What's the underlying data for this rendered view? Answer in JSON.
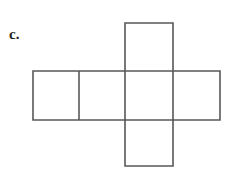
{
  "figure": {
    "label": "c.",
    "caption": "",
    "kind": "cube-net-cross",
    "background_color": "#ffffff",
    "stroke_color": "#58585a",
    "fill_color": "#ffffff",
    "stroke_width": 1.6,
    "square_size": 47,
    "squares_total": 6,
    "horizontal_band": {
      "squares": 4,
      "x": 33,
      "y": 71,
      "width": 187,
      "height": 49,
      "divider_x": [
        79
      ]
    },
    "vertical_strip": {
      "squares": 3,
      "x": 125,
      "y": 23,
      "width": 48,
      "height": 143
    },
    "cells": [
      {
        "name": "band-square-1",
        "x": 33,
        "y": 71,
        "w": 46,
        "h": 49
      },
      {
        "name": "band-square-2",
        "x": 79,
        "y": 71,
        "w": 46,
        "h": 49
      },
      {
        "name": "band-square-3",
        "x": 125,
        "y": 71,
        "w": 48,
        "h": 49
      },
      {
        "name": "band-square-4",
        "x": 173,
        "y": 71,
        "w": 47,
        "h": 49
      },
      {
        "name": "strip-square-top",
        "x": 125,
        "y": 23,
        "w": 48,
        "h": 48
      },
      {
        "name": "strip-square-bottom",
        "x": 125,
        "y": 120,
        "w": 48,
        "h": 46
      }
    ]
  }
}
